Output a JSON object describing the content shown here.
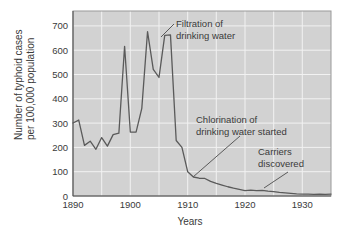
{
  "chart_data": {
    "type": "line",
    "title": "",
    "xlabel": "Years",
    "ylabel": "Number of typhoid cases per 100,000 population",
    "ylabel_line1": "Number of typhoid cases",
    "ylabel_line2": "per 100,000 population",
    "xlim": [
      1890,
      1935
    ],
    "ylim": [
      0,
      760
    ],
    "grid": true,
    "legend": "none",
    "background_color": "#d2d2d2",
    "gridline_color": "#f2f2f2",
    "line_color": "#5a5a5a",
    "text_color": "#3a3a3a",
    "xticks": [
      1890,
      1900,
      1910,
      1920,
      1930
    ],
    "xtick_labels": [
      "1890",
      "1900",
      "1910",
      "1920",
      "1930"
    ],
    "yticks": [
      0,
      100,
      200,
      300,
      400,
      500,
      600,
      700
    ],
    "ytick_labels": [
      "0",
      "100",
      "200",
      "300",
      "400",
      "500",
      "600",
      "700"
    ],
    "series": [
      {
        "name": "Typhoid cases per 100,000",
        "x": [
          1890,
          1891,
          1892,
          1893,
          1894,
          1895,
          1896,
          1897,
          1898,
          1899,
          1900,
          1901,
          1902,
          1903,
          1904,
          1905,
          1906,
          1907,
          1908,
          1909,
          1910,
          1911,
          1912,
          1913,
          1914,
          1915,
          1916,
          1917,
          1918,
          1919,
          1920,
          1921,
          1922,
          1923,
          1924,
          1925,
          1926,
          1927,
          1928,
          1929,
          1930,
          1931,
          1932,
          1933,
          1934,
          1935
        ],
        "values": [
          300,
          312,
          208,
          225,
          192,
          240,
          205,
          252,
          258,
          615,
          263,
          262,
          360,
          675,
          520,
          487,
          660,
          662,
          228,
          200,
          100,
          78,
          73,
          72,
          60,
          52,
          45,
          38,
          32,
          27,
          22,
          24,
          22,
          23,
          20,
          18,
          15,
          13,
          11,
          9,
          8,
          8,
          7,
          8,
          7,
          8
        ]
      }
    ],
    "annotations": [
      {
        "id": "filtration",
        "line1": "Filtration of",
        "line2": "drinking water",
        "target_x": 1906,
        "target_y": 660
      },
      {
        "id": "chlorination",
        "line1": "Chlorination of",
        "line2": "drinking water started",
        "target_x": 1912,
        "target_y": 73
      },
      {
        "id": "carriers",
        "line1": "Carriers",
        "line2": "discovered",
        "target_x": 1926,
        "target_y": 15
      }
    ]
  }
}
